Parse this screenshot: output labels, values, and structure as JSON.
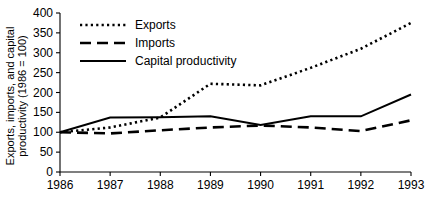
{
  "chart_data": {
    "type": "line",
    "title": "",
    "xlabel": "",
    "ylabel": "Exports, imports, and capital productivity (1986 = 100)",
    "ylabel_line1": "Exports, imports, and capital",
    "ylabel_line2": "productivity (1986 = 100)",
    "categories": [
      "1986",
      "1987",
      "1988",
      "1989",
      "1990",
      "1991",
      "1992",
      "1993"
    ],
    "x": [
      1986,
      1987,
      1988,
      1989,
      1990,
      1991,
      1992,
      1993
    ],
    "xlim": [
      1986,
      1993
    ],
    "ylim": [
      0,
      400
    ],
    "yticks": [
      0,
      50,
      100,
      150,
      200,
      250,
      300,
      350,
      400
    ],
    "ytick_labels": [
      "0",
      "50",
      "100",
      "150",
      "200",
      "250",
      "300",
      "350",
      "400"
    ],
    "xticks": [
      1986,
      1987,
      1988,
      1989,
      1990,
      1991,
      1992,
      1993
    ],
    "xtick_labels": [
      "1986",
      "1987",
      "1988",
      "1989",
      "1990",
      "1991",
      "1992",
      "1993"
    ],
    "grid": false,
    "legend_position": "upper-left",
    "series": [
      {
        "name": "Exports",
        "style": "dotted",
        "values": [
          100,
          112,
          137,
          222,
          218,
          262,
          310,
          375
        ]
      },
      {
        "name": "Imports",
        "style": "dashed",
        "values": [
          100,
          97,
          105,
          112,
          117,
          112,
          103,
          130
        ]
      },
      {
        "name": "Capital productivity",
        "style": "solid",
        "values": [
          100,
          137,
          138,
          140,
          118,
          140,
          140,
          195
        ]
      }
    ]
  },
  "legend": {
    "items": [
      {
        "label": "Exports",
        "style": "dotted"
      },
      {
        "label": "Imports",
        "style": "dashed"
      },
      {
        "label": "Capital productivity",
        "style": "solid"
      }
    ]
  },
  "colors": {
    "ink": "#000000",
    "background": "#ffffff"
  }
}
